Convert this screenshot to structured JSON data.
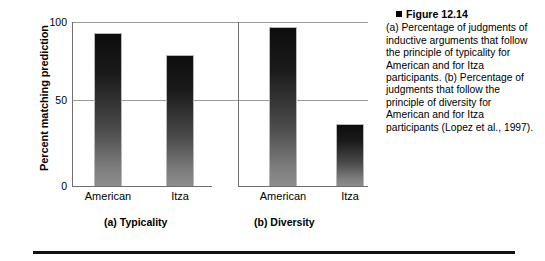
{
  "figure": {
    "bullet_icon": "filled-square-bullet",
    "title": "Figure 12.14",
    "caption": "(a) Percentage of judgments of inductive arguments that follow the principle of typicality for American and for Itza participants. (b) Percentage of judgments that follow the principle of diversity for American and for Itza participants (Lopez et al., 1997)."
  },
  "chart_data": [
    {
      "type": "bar",
      "title": "(a) Typicality",
      "categories": [
        "American",
        "Itza"
      ],
      "values": [
        93,
        80
      ],
      "xlabel": "",
      "ylabel": "Percent matching prediction",
      "ylim": [
        0,
        100
      ],
      "yticks": [
        0,
        50,
        100
      ],
      "ytick_labels": [
        "0",
        "50",
        "100"
      ],
      "grid": true,
      "legend": "none",
      "bar_color_top": "#0d0d0d",
      "bar_color_bottom": "#8d8d8d"
    },
    {
      "type": "bar",
      "title": "(b) Diversity",
      "categories": [
        "American",
        "Itza"
      ],
      "values": [
        97,
        38
      ],
      "xlabel": "",
      "ylabel": "Percent matching prediction",
      "ylim": [
        0,
        100
      ],
      "yticks": [
        0,
        50,
        100
      ],
      "ytick_labels": [
        "0",
        "50",
        "100"
      ],
      "grid": true,
      "legend": "none",
      "bar_color_top": "#0d0d0d",
      "bar_color_bottom": "#8d8d8d"
    }
  ],
  "axis": {
    "y_title": "Percent matching prediction",
    "tick_100": "100",
    "tick_50": "50",
    "tick_0": "0"
  },
  "panel_a": {
    "caption": "(a) Typicality",
    "cat_american": "American",
    "cat_itza": "Itza"
  },
  "panel_b": {
    "caption": "(b) Diversity",
    "cat_american": "American",
    "cat_itza": "Itza"
  }
}
